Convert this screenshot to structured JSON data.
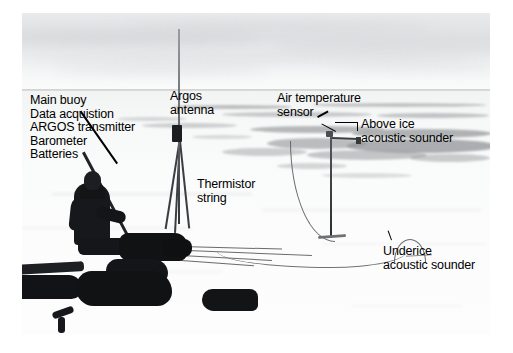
{
  "figure": {
    "kind": "annotated-photograph",
    "palette": {
      "ink": "#000000",
      "paper": "#ffffff",
      "sky": "#e4e6e8",
      "ice": "#fafbfb",
      "pond": "#8e9194",
      "hardware": "#16181b"
    }
  },
  "annotations": {
    "main_buoy": {
      "lines": [
        "Main buoy",
        "Data acquistion",
        "ARGOS transmitter",
        "Barometer",
        "Batteries"
      ]
    },
    "argos_antenna": {
      "lines": [
        "Argos",
        "antenna"
      ]
    },
    "air_temperature_sensor": {
      "lines": [
        "Air temperature",
        "sensor"
      ]
    },
    "above_ice_acoustic_sounder": {
      "lines": [
        "Above ice",
        "acoustic sounder"
      ]
    },
    "thermistor_string": {
      "lines": [
        "Thermistor",
        "string"
      ]
    },
    "underice_acoustic_sounder": {
      "lines": [
        "Underice",
        "acoustic sounder"
      ]
    }
  }
}
